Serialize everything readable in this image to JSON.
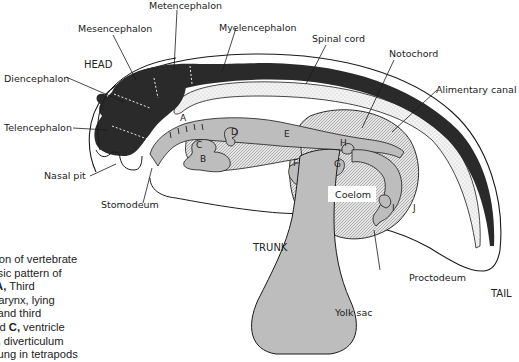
{
  "diagram": {
    "regions": {
      "head": "HEAD",
      "trunk": "TRUNK",
      "tail": "TAIL"
    },
    "labels": {
      "metencephalon": "Metencephalon",
      "mesencephalon": "Mesencephalon",
      "myelencephalon": "Myelencephalon",
      "diencephalon": "Diencephalon",
      "telencephalon": "Telencephalon",
      "spinal_cord": "Spinal cord",
      "notochord": "Notochord",
      "alimentary_canal": "Alimentary canal",
      "nasal_pit": "Nasal pit",
      "stomodeum": "Stomodeum",
      "coelom": "Coelom",
      "proctodeum": "Proctodeum",
      "yolk_sac": "Yolk sac"
    },
    "letters": {
      "A": "A",
      "B": "B",
      "C": "C",
      "D": "D",
      "E": "E",
      "F": "F",
      "G": "G",
      "H": "H",
      "I": "I",
      "J": "J"
    },
    "colors": {
      "neural": "#2a2a2a",
      "gut": "#b9b9b9",
      "coelom_hatch": "#cfcfcf",
      "notochord_stipple": "#ececec",
      "outline": "#1a1a1a"
    }
  },
  "caption": {
    "lines": [
      {
        "pre": "al section of vertebrate",
        "bold": "",
        "post": ""
      },
      {
        "pre": "ting basic pattern of",
        "bold": "",
        "post": ""
      },
      {
        "pre": "cture. ",
        "bold": "A,",
        "post": " Third"
      },
      {
        "pre": "h of pharynx, lying",
        "bold": "",
        "post": ""
      },
      {
        "pre": "econd and third",
        "bold": "",
        "post": ""
      },
      {
        "pre": "s; ",
        "bold": "B",
        "post": " and "
      },
      {
        "pre": "eart; ",
        "bold": "D,",
        "post": " diverticulum"
      },
      {
        "pre": "to the lung in tetrapods",
        "bold": "",
        "post": ""
      }
    ],
    "line6_extra_bold": "C,",
    "line6_tail": " ventricle"
  }
}
